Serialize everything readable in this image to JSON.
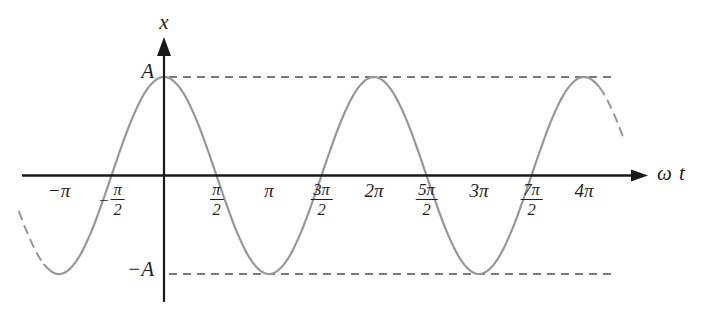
{
  "figure_meta": {
    "description": "Sinusoidal oscillation graph (simple harmonic motion): displacement x versus phase ωt",
    "background": "#ffffff"
  },
  "colors": {
    "curve": "#979797",
    "axis": "#1a1a1a",
    "guide_dash": "#4f4f4f",
    "text": "#1f1f1f"
  },
  "chart_data": {
    "type": "line",
    "title": "",
    "function": "x = A cos(ω t)",
    "xlabel": "ω t",
    "ylabel": "x",
    "amplitude": 1,
    "amplitude_label_top": "A",
    "amplitude_label_bottom": "−A",
    "x_unit": "π rad",
    "x_range_pi": [
      -1.45,
      4.6
    ],
    "y_range": [
      -1.4,
      1.55
    ],
    "grid": false,
    "legend": false,
    "solid_domain_pi": [
      -1.14,
      4.15
    ],
    "dashed_extension_left_pi": [
      -1.38,
      -1.14
    ],
    "dashed_extension_right_pi": [
      4.15,
      4.38
    ],
    "guide_lines": [
      {
        "y": 1,
        "label": "A",
        "style": "dashed"
      },
      {
        "y": -1,
        "label": "−A",
        "style": "dashed"
      }
    ],
    "x_ticks": [
      {
        "value_pi": -1,
        "text": "−π"
      },
      {
        "value_pi": -0.5,
        "minus": "−",
        "num": "π",
        "den": "2"
      },
      {
        "value_pi": 0.5,
        "num": "π",
        "den": "2"
      },
      {
        "value_pi": 1,
        "text": "π"
      },
      {
        "value_pi": 1.5,
        "num": "3π",
        "den": "2"
      },
      {
        "value_pi": 2,
        "text": "2π"
      },
      {
        "value_pi": 2.5,
        "num": "5π",
        "den": "2"
      },
      {
        "value_pi": 3,
        "text": "3π"
      },
      {
        "value_pi": 3.5,
        "num": "7π",
        "den": "2"
      },
      {
        "value_pi": 4,
        "text": "4π"
      }
    ],
    "key_points": {
      "maxima_at_pi": [
        0,
        2,
        4
      ],
      "minima_at_pi": [
        -1,
        1,
        3
      ],
      "zeros_at_pi": [
        -0.5,
        0.5,
        1.5,
        2.5,
        3.5
      ],
      "value_at_maxima": "A",
      "value_at_minima": "−A"
    }
  }
}
